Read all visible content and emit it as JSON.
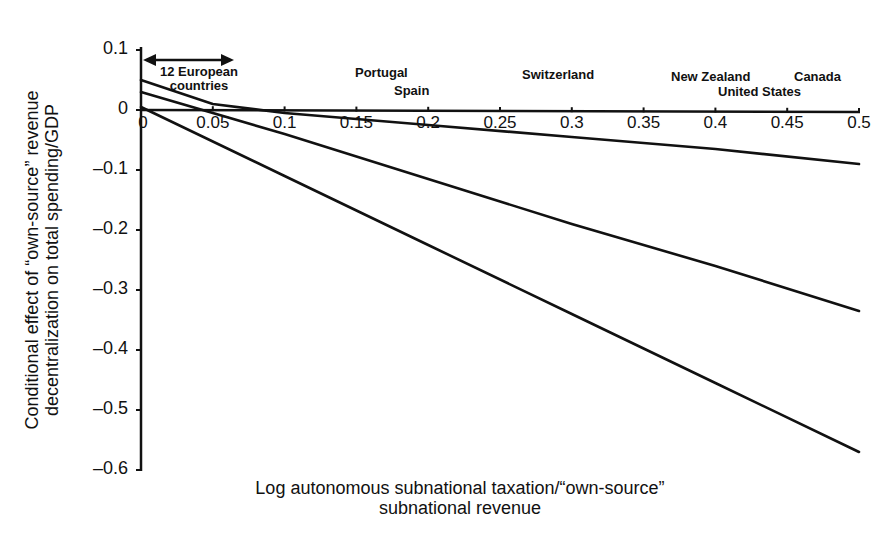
{
  "chart_data": {
    "type": "line",
    "title": "",
    "xlabel": "Log autonomous subnational taxation/“own-source” subnational revenue",
    "xlabel_lines": [
      "Log autonomous subnational taxation/“own-source”",
      "subnational revenue"
    ],
    "ylabel": "Conditional effect of “own-source” revenue decentralization on total spending/GDP",
    "ylabel_lines": [
      "Conditional effect of “own-source” revenue",
      "decentralization on total spending/GDP"
    ],
    "xlim": [
      0,
      0.5
    ],
    "ylim": [
      -0.6,
      0.1
    ],
    "x_ticks": [
      "0",
      "0.05",
      "0.1",
      "0.15",
      "0.2",
      "0.25",
      "0.3",
      "0.35",
      "0.4",
      "0.45",
      "0.5"
    ],
    "y_ticks": [
      "0.1",
      "0",
      "–0.1",
      "–0.2",
      "–0.3",
      "–0.4",
      "–0.5",
      "–0.6"
    ],
    "grid": false,
    "legend": null,
    "series": [
      {
        "name": "upper bound",
        "x": [
          0,
          0.05,
          0.1,
          0.2,
          0.3,
          0.4,
          0.5
        ],
        "values": [
          0.05,
          0.01,
          -0.005,
          -0.025,
          -0.045,
          -0.065,
          -0.09
        ]
      },
      {
        "name": "conditional effect",
        "x": [
          0,
          0.1,
          0.2,
          0.3,
          0.4,
          0.5
        ],
        "values": [
          0.03,
          -0.04,
          -0.115,
          -0.19,
          -0.26,
          -0.335
        ]
      },
      {
        "name": "lower bound",
        "x": [
          0,
          0.1,
          0.2,
          0.3,
          0.4,
          0.5
        ],
        "values": [
          0.005,
          -0.11,
          -0.225,
          -0.34,
          -0.455,
          -0.57
        ]
      }
    ],
    "annotations": [
      {
        "text": "12 European countries",
        "x_range": [
          0,
          0.065
        ],
        "type": "double-arrow"
      },
      {
        "text": "Portugal",
        "x": 0.17
      },
      {
        "text": "Spain",
        "x": 0.2
      },
      {
        "text": "Switzerland",
        "x": 0.3
      },
      {
        "text": "New Zealand",
        "x": 0.41
      },
      {
        "text": "United States",
        "x": 0.44
      },
      {
        "text": "Canada",
        "x": 0.48
      }
    ]
  },
  "labels": {
    "ylabel_line1": "Conditional effect of “own-source” revenue",
    "ylabel_line2": "decentralization on total spending/GDP",
    "xlabel_line1": "Log autonomous subnational taxation/“own-source”",
    "xlabel_line2": "subnational revenue",
    "europe_line1": "12 European",
    "europe_line2": "countries",
    "portugal": "Portugal",
    "spain": "Spain",
    "switzerland": "Switzerland",
    "new_zealand": "New Zealand",
    "united_states": "United States",
    "canada": "Canada"
  },
  "ticks": {
    "y": [
      "0.1",
      "0",
      "–0.1",
      "–0.2",
      "–0.3",
      "–0.4",
      "–0.5",
      "–0.6"
    ],
    "x": [
      "0",
      "0.05",
      "0.1",
      "0.15",
      "0.2",
      "0.25",
      "0.3",
      "0.35",
      "0.4",
      "0.45",
      "0.5"
    ]
  }
}
